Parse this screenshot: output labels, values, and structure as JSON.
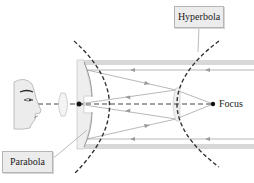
{
  "diagram": {
    "labels": {
      "hyperbola": "Hyperbola",
      "parabola": "Parabola",
      "focus": "Focus"
    },
    "components": [
      {
        "id": "observer-eye",
        "name": "observer face"
      },
      {
        "id": "eyepiece-lens",
        "name": "eyepiece lens"
      },
      {
        "id": "primary-mirror",
        "name": "parabolic primary mirror"
      },
      {
        "id": "secondary-mirror",
        "name": "hyperbolic secondary mirror"
      },
      {
        "id": "focus-point",
        "name": "focus"
      },
      {
        "id": "telescope-tube",
        "name": "telescope tube"
      }
    ],
    "colors": {
      "curve": "#333333",
      "ray": "#9a9a9a",
      "tube": "#d4d4d4",
      "label_bg": "#ececec",
      "label_border": "#b5b5b5",
      "dot": "#111111"
    }
  }
}
